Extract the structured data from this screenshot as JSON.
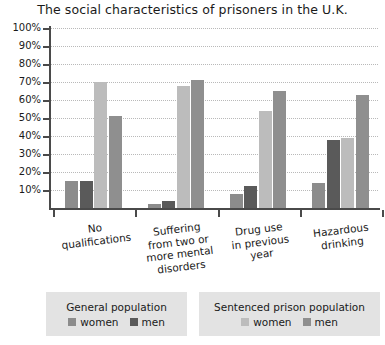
{
  "chart_data": {
    "type": "bar",
    "title": "The social characteristics of prisoners in the U.K.",
    "xlabel": "",
    "ylabel": "",
    "ylim": [
      0,
      100
    ],
    "grid": true,
    "legend_position": "bottom",
    "categories": [
      "No\nqualifications",
      "Suffering\nfrom two or\nmore mental\ndisorders",
      "Drug use\nin previous\nyear",
      "Hazardous\ndrinking"
    ],
    "ytick_labels": [
      "100%",
      "90%",
      "80%",
      "70%",
      "60%",
      "50%",
      "40%",
      "30%",
      "20%",
      "10%"
    ],
    "ytick_values": [
      100,
      90,
      80,
      70,
      60,
      50,
      40,
      30,
      20,
      10
    ],
    "series": [
      {
        "name": "women",
        "group": "General population",
        "color": "#8c8c8c",
        "values": [
          15,
          2,
          8,
          14
        ]
      },
      {
        "name": "men",
        "group": "General population",
        "color": "#5a5a5a",
        "values": [
          15,
          4,
          12,
          38
        ]
      },
      {
        "name": "women",
        "group": "Sentenced prison population",
        "color": "#bcbcbc",
        "values": [
          70,
          68,
          54,
          39
        ]
      },
      {
        "name": "men",
        "group": "Sentenced prison population",
        "color": "#8f8f8f",
        "values": [
          51,
          71,
          65,
          63
        ]
      }
    ]
  },
  "legend": [
    {
      "title": "General population",
      "entries": [
        {
          "label": "women",
          "color": "#8c8c8c"
        },
        {
          "label": "men",
          "color": "#5a5a5a"
        }
      ]
    },
    {
      "title": "Sentenced prison population",
      "entries": [
        {
          "label": "women",
          "color": "#bcbcbc"
        },
        {
          "label": "men",
          "color": "#8f8f8f"
        }
      ]
    }
  ]
}
